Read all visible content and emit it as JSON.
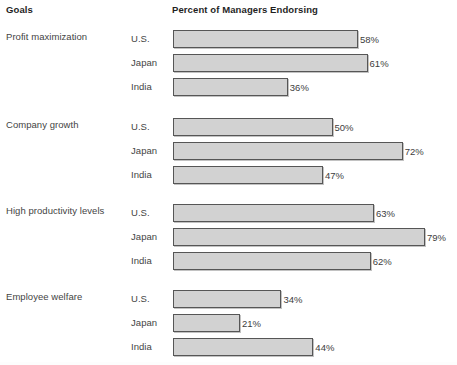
{
  "header": {
    "goals_label": "Goals",
    "percent_label": "Percent of Managers Endorsing"
  },
  "chart_data": {
    "type": "bar",
    "orientation": "horizontal",
    "title": "Percent of Managers Endorsing",
    "xlabel": "Percent of Managers Endorsing",
    "ylabel": "Goals",
    "xlim": [
      0,
      100
    ],
    "grid": false,
    "legend": "none",
    "categories": [
      "Profit maximization",
      "Company growth",
      "High productivity levels",
      "Employee welfare"
    ],
    "series": [
      {
        "name": "U.S.",
        "values": [
          58,
          50,
          63,
          34
        ]
      },
      {
        "name": "Japan",
        "values": [
          61,
          72,
          79,
          21
        ]
      },
      {
        "name": "India",
        "values": [
          36,
          47,
          62,
          44
        ]
      }
    ],
    "groups": [
      {
        "label": "Profit maximization",
        "bars": [
          {
            "country": "U.S.",
            "value": 58,
            "value_label": "58%"
          },
          {
            "country": "Japan",
            "value": 61,
            "value_label": "61%"
          },
          {
            "country": "India",
            "value": 36,
            "value_label": "36%"
          }
        ]
      },
      {
        "label": "Company growth",
        "bars": [
          {
            "country": "U.S.",
            "value": 50,
            "value_label": "50%"
          },
          {
            "country": "Japan",
            "value": 72,
            "value_label": "72%"
          },
          {
            "country": "India",
            "value": 47,
            "value_label": "47%"
          }
        ]
      },
      {
        "label": "High productivity levels",
        "bars": [
          {
            "country": "U.S.",
            "value": 63,
            "value_label": "63%"
          },
          {
            "country": "Japan",
            "value": 79,
            "value_label": "79%"
          },
          {
            "country": "India",
            "value": 62,
            "value_label": "62%"
          }
        ]
      },
      {
        "label": "Employee welfare",
        "bars": [
          {
            "country": "U.S.",
            "value": 34,
            "value_label": "34%"
          },
          {
            "country": "Japan",
            "value": 21,
            "value_label": "21%"
          },
          {
            "country": "India",
            "value": 44,
            "value_label": "44%"
          }
        ]
      }
    ]
  },
  "style": {
    "bar_fill": "#d2d2d2",
    "bar_border": "#565656",
    "text": "#444444",
    "header_text": "#1f1f1f",
    "background": "#ffffff"
  },
  "layout": {
    "px_per_percent": 3.19,
    "bar_origin_x": 173,
    "bar_height": 18,
    "row_pitch": 24,
    "group_tops": [
      30,
      118,
      204,
      290
    ]
  }
}
